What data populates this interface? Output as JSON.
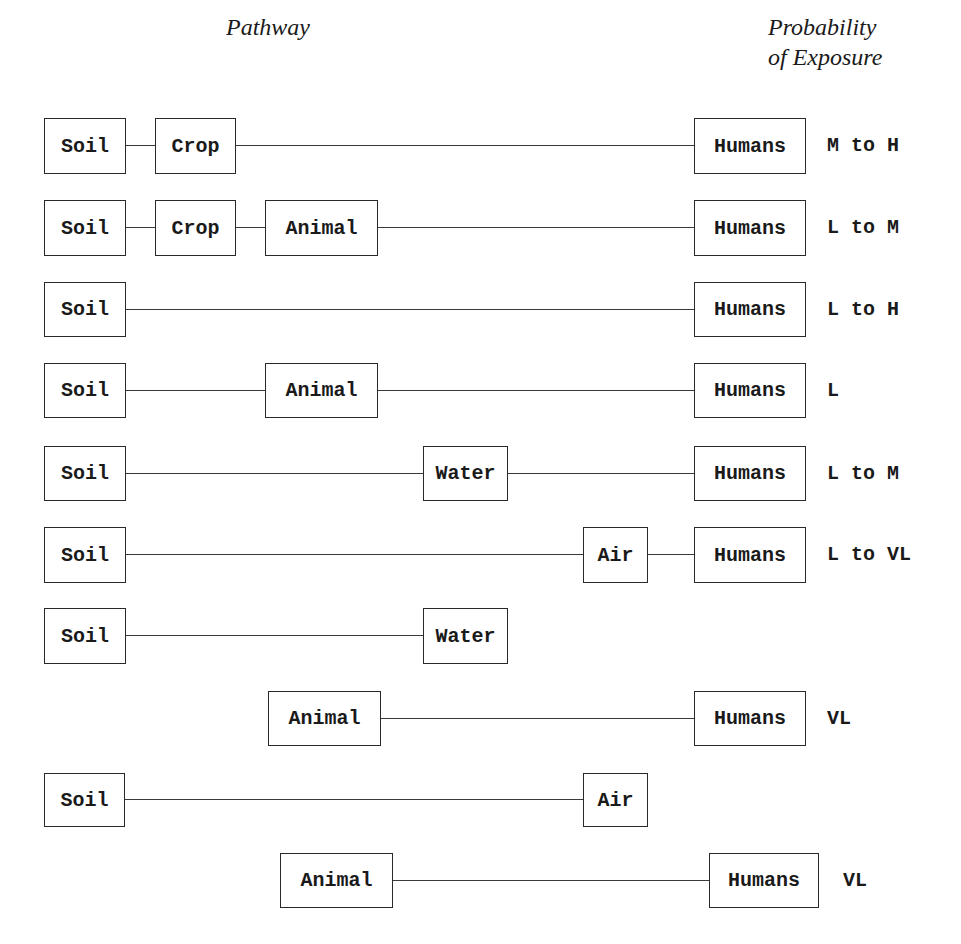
{
  "headers": {
    "pathway": "Pathway",
    "probability_line1": "Probability",
    "probability_line2": "of Exposure"
  },
  "rows": [
    {
      "nodes": [
        {
          "label": "Soil",
          "x": 44,
          "w": 82
        },
        {
          "label": "Crop",
          "x": 155,
          "w": 81
        },
        {
          "label": "Humans",
          "x": 694,
          "w": 112
        }
      ],
      "y": 118,
      "h": 56,
      "probability": "M to H",
      "prob_x": 827
    },
    {
      "nodes": [
        {
          "label": "Soil",
          "x": 44,
          "w": 82
        },
        {
          "label": "Crop",
          "x": 155,
          "w": 81
        },
        {
          "label": "Animal",
          "x": 265,
          "w": 113
        },
        {
          "label": "Humans",
          "x": 694,
          "w": 112
        }
      ],
      "y": 200,
      "h": 56,
      "probability": "L to M",
      "prob_x": 827
    },
    {
      "nodes": [
        {
          "label": "Soil",
          "x": 44,
          "w": 82
        },
        {
          "label": "Humans",
          "x": 694,
          "w": 112
        }
      ],
      "y": 282,
      "h": 55,
      "probability": "L to H",
      "prob_x": 827
    },
    {
      "nodes": [
        {
          "label": "Soil",
          "x": 44,
          "w": 82
        },
        {
          "label": "Animal",
          "x": 265,
          "w": 113
        },
        {
          "label": "Humans",
          "x": 694,
          "w": 112
        }
      ],
      "y": 363,
      "h": 55,
      "probability": "L",
      "prob_x": 827
    },
    {
      "nodes": [
        {
          "label": "Soil",
          "x": 44,
          "w": 82
        },
        {
          "label": "Water",
          "x": 423,
          "w": 85
        },
        {
          "label": "Humans",
          "x": 694,
          "w": 112
        }
      ],
      "y": 446,
      "h": 55,
      "probability": "L to M",
      "prob_x": 827
    },
    {
      "nodes": [
        {
          "label": "Soil",
          "x": 44,
          "w": 82
        },
        {
          "label": "Air",
          "x": 583,
          "w": 65
        },
        {
          "label": "Humans",
          "x": 694,
          "w": 112
        }
      ],
      "y": 527,
      "h": 56,
      "probability": "L to VL",
      "prob_x": 827
    },
    {
      "nodes": [
        {
          "label": "Soil",
          "x": 44,
          "w": 82
        },
        {
          "label": "Water",
          "x": 423,
          "w": 85
        }
      ],
      "y": 608,
      "h": 56,
      "probability": "",
      "prob_x": 827
    },
    {
      "nodes": [
        {
          "label": "Animal",
          "x": 268,
          "w": 113
        },
        {
          "label": "Humans",
          "x": 694,
          "w": 112
        }
      ],
      "y": 691,
      "h": 55,
      "probability": "VL",
      "prob_x": 827
    },
    {
      "nodes": [
        {
          "label": "Soil",
          "x": 44,
          "w": 81
        },
        {
          "label": "Air",
          "x": 583,
          "w": 65
        }
      ],
      "y": 773,
      "h": 54,
      "probability": "",
      "prob_x": 827
    },
    {
      "nodes": [
        {
          "label": "Animal",
          "x": 280,
          "w": 113
        },
        {
          "label": "Humans",
          "x": 709,
          "w": 110
        }
      ],
      "y": 853,
      "h": 55,
      "probability": "VL",
      "prob_x": 843
    }
  ],
  "colors": {
    "stroke": "#2a2a2a",
    "text": "#1a1a1a",
    "background": "#ffffff"
  }
}
